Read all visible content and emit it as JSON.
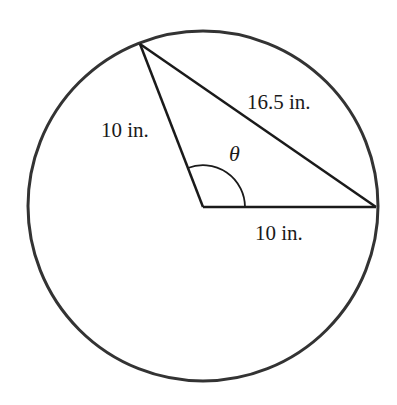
{
  "figure": {
    "type": "circle-with-inscribed-triangle",
    "stroke_color": "#1a1a1a",
    "circle_stroke_color": "#333333",
    "labels": {
      "radius_left": "10 in.",
      "radius_bottom": "10 in.",
      "chord": "16.5 in.",
      "angle": "θ"
    }
  }
}
